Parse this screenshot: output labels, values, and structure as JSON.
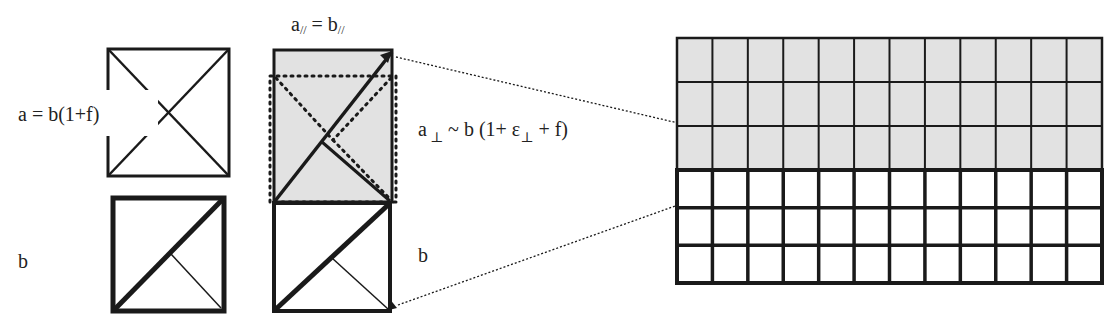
{
  "labels": {
    "top_equation": "a = b(1+f)",
    "bottom_left": "b",
    "parallel_a": "a",
    "parallel_sub_a": "//",
    "parallel_eq": " = ",
    "parallel_b": "b",
    "parallel_sub_b": "//",
    "perp_a": "a",
    "perp_sub": "⊥",
    "perp_rest": " ~ b (1+ ε",
    "perp_sub2": "⊥",
    "perp_end": " + f)",
    "bottom_middle": "b"
  },
  "grid": {
    "columns": 12,
    "gray_rows": 3,
    "white_rows": 3
  },
  "colors": {
    "stroke": "#1a1a1a",
    "gray_fill": "#e2e2e2",
    "white_fill": "#ffffff"
  }
}
